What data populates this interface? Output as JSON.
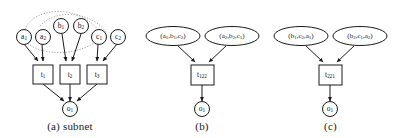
{
  "figure": {
    "type": "diagram"
  },
  "panels": [
    {
      "id": "a",
      "caption": "(a) subnet",
      "input_nodes": [
        {
          "id": "a1",
          "base": "a",
          "sub": "1"
        },
        {
          "id": "a2",
          "base": "a",
          "sub": "2"
        },
        {
          "id": "b1",
          "base": "b",
          "sub": "1"
        },
        {
          "id": "b2",
          "base": "b",
          "sub": "2"
        },
        {
          "id": "c1",
          "base": "c",
          "sub": "1"
        },
        {
          "id": "c2",
          "base": "c",
          "sub": "2"
        }
      ],
      "transition_nodes": [
        {
          "id": "t1",
          "base": "t",
          "sub": "1"
        },
        {
          "id": "t2",
          "base": "t",
          "sub": "2"
        },
        {
          "id": "t3",
          "base": "t",
          "sub": "3"
        }
      ],
      "output_nodes": [
        {
          "id": "o1",
          "base": "o",
          "sub": "1"
        }
      ],
      "has_dotted_arcs": "true"
    },
    {
      "id": "b",
      "caption": "(b)",
      "tuple_nodes": [
        {
          "id": "tuple-b-1",
          "open": "(",
          "parts": [
            {
              "base": "a",
              "sub": "1"
            },
            {
              "base": "b",
              "sub": "1"
            },
            {
              "base": "c",
              "sub": "2"
            }
          ],
          "close": ")",
          "sep": ","
        },
        {
          "id": "tuple-b-2",
          "open": "(",
          "parts": [
            {
              "base": "a",
              "sub": "2"
            },
            {
              "base": "b",
              "sub": "2"
            },
            {
              "base": "c",
              "sub": "1"
            }
          ],
          "close": ")",
          "sep": ","
        }
      ],
      "transition_nodes": [
        {
          "id": "t122",
          "base": "t",
          "sub": "122"
        }
      ],
      "output_nodes": [
        {
          "id": "o1",
          "base": "o",
          "sub": "1"
        }
      ]
    },
    {
      "id": "c",
      "caption": "(c)",
      "tuple_nodes": [
        {
          "id": "tuple-c-1",
          "open": "(",
          "parts": [
            {
              "base": "b",
              "sub": "1"
            },
            {
              "base": "c",
              "sub": "2"
            },
            {
              "base": "a",
              "sub": "1"
            }
          ],
          "close": ")",
          "sep": ","
        },
        {
          "id": "tuple-c-2",
          "open": "(",
          "parts": [
            {
              "base": "b",
              "sub": "2"
            },
            {
              "base": "c",
              "sub": "1"
            },
            {
              "base": "a",
              "sub": "2"
            }
          ],
          "close": ")",
          "sep": ","
        }
      ],
      "transition_nodes": [
        {
          "id": "t221",
          "base": "t",
          "sub": "221"
        }
      ],
      "output_nodes": [
        {
          "id": "o1",
          "base": "o",
          "sub": "1"
        }
      ]
    }
  ],
  "colors": {
    "stroke": "#1a1a1a",
    "fill": "#ffffff",
    "dotted_arc": "#9a9a9a",
    "background": "#ffffff"
  }
}
